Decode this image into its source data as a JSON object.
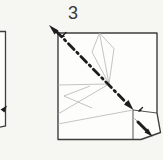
{
  "figure": {
    "step_number": "3"
  },
  "colors": {
    "bg": "#f6f6f3",
    "paper": "#fdfdfb",
    "outline": "#3e3e3e",
    "crease": "#ababab",
    "bold": "#1d1d1d",
    "text": "#3a3a3a"
  },
  "icons": {
    "fold_axis_start_arrowhead": "solid triangle pointing up-left",
    "fold_axis_end_arrowhead": "solid triangle pointing down-right",
    "flap_fold_arrowhead": "solid triangle pointing down-right",
    "prev_step_arrowhead": "solid triangle pointing up-right",
    "fold_direction_tick_top": "small arrow tick pointing down-left",
    "fold_direction_tick_flap": "small arrow tick pointing down-left"
  }
}
